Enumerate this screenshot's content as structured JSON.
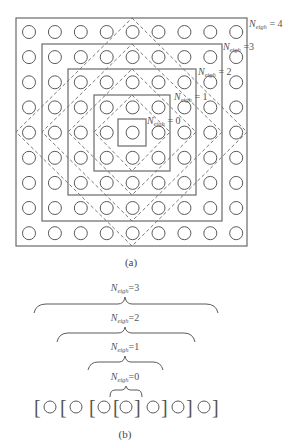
{
  "figure_a": {
    "caption": "(a)",
    "grid": {
      "rows": 9,
      "cols": 9
    },
    "labels": [
      {
        "symbol": "N",
        "sub": "eigh",
        "rest": " = 4"
      },
      {
        "symbol": "N",
        "sub": "eigh",
        "rest": " =3"
      },
      {
        "symbol": "N",
        "sub": "eigh",
        "rest": " = 2"
      },
      {
        "symbol": "N",
        "sub": "eigh",
        "rest": " = 1"
      },
      {
        "symbol": "N",
        "sub": "eigh",
        "rest": " = 0"
      }
    ]
  },
  "figure_b": {
    "caption": "(b)",
    "labels": [
      {
        "symbol": "N",
        "sub": "eigh",
        "rest": "=3"
      },
      {
        "symbol": "N",
        "sub": "eigh",
        "rest": "=2"
      },
      {
        "symbol": "N",
        "sub": "eigh",
        "rest": "=1"
      },
      {
        "symbol": "N",
        "sub": "eigh",
        "rest": "=0"
      }
    ],
    "brackets": {
      "open": "[",
      "close": "]"
    }
  },
  "colors": {
    "stroke": "#6a6a6a",
    "text": "#555555",
    "background": "#ffffff"
  }
}
